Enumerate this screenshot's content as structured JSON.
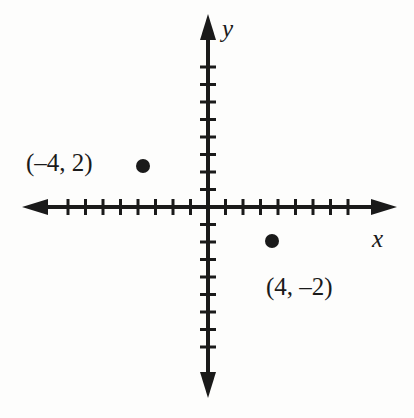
{
  "figure": {
    "background_color": "#fdfdfc",
    "ink_color": "#1a1a1a"
  },
  "axes": {
    "x_label": "x",
    "y_label": "y",
    "x_label_name": "x-axis-label",
    "y_label_name": "y-axis-label",
    "origin_px": {
      "x": 208,
      "y": 207
    },
    "unit_px": 17.5,
    "x_ticks_negative": 8,
    "x_ticks_positive": 8,
    "y_ticks_negative": 8,
    "y_ticks_positive": 8,
    "x_arrow_left_px": 22,
    "x_arrow_right_px": 397,
    "y_arrow_top_px": 14,
    "y_arrow_bottom_px": 398,
    "tick_length_px": 16,
    "axis_thickness_px": 4,
    "tick_thickness_px": 3,
    "arrows": "both-ends",
    "gridlines": false,
    "tick_numbers_shown": false
  },
  "chart_data": {
    "type": "scatter",
    "title": "",
    "xlabel": "x",
    "ylabel": "y",
    "xlim": [
      -10,
      10
    ],
    "ylim": [
      -10,
      10
    ],
    "grid": false,
    "legend": "none",
    "points": [
      {
        "id": "point-a",
        "label": "(–4, 2)",
        "x": -4,
        "y": 2,
        "marker": "filled-circle",
        "marker_radius_px": 7,
        "pixel": {
          "x": 143,
          "y": 166
        },
        "label_position": "left-of-point"
      },
      {
        "id": "point-b",
        "label": "(4, –2)",
        "x": 4,
        "y": -2,
        "marker": "filled-circle",
        "marker_radius_px": 7,
        "pixel": {
          "x": 272,
          "y": 241
        },
        "label_position": "below-point"
      }
    ]
  },
  "labels": {
    "point_a_text": "(–4, 2)",
    "point_b_text": "(4, –2)"
  }
}
